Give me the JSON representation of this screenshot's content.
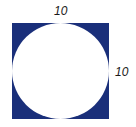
{
  "diagram": {
    "square": {
      "fill_color": "#1a2f7a",
      "side_top_label": "10",
      "side_right_label": "10"
    },
    "circle": {
      "fill_color": "#ffffff"
    }
  }
}
